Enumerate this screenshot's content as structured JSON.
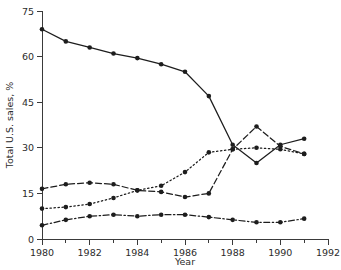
{
  "chart_data": {
    "type": "line",
    "title": "",
    "xlabel": "Year",
    "ylabel": "Total U.S. sales, %",
    "xlim": [
      1980,
      1992
    ],
    "ylim": [
      0,
      75
    ],
    "grid": false,
    "legend": "none",
    "x_major_ticks": [
      1980,
      1982,
      1984,
      1986,
      1988,
      1990,
      1992
    ],
    "x_minor_ticks": [
      1981,
      1983,
      1985,
      1987,
      1989,
      1991
    ],
    "x_tick_labels": [
      "1980",
      "1982",
      "1984",
      "1986",
      "1988",
      "1990",
      "1992"
    ],
    "y_ticks": [
      0,
      15,
      30,
      45,
      60,
      75
    ],
    "y_tick_labels": [
      "0",
      "15",
      "30",
      "45",
      "60",
      "75"
    ],
    "x": [
      1980,
      1981,
      1982,
      1983,
      1984,
      1985,
      1986,
      1987,
      1988,
      1989,
      1990,
      1991
    ],
    "series": [
      {
        "name": "series-solid",
        "style": "solid",
        "marker": "filled-circle",
        "values": [
          69,
          65,
          63,
          61,
          59.5,
          57.5,
          55,
          47,
          31,
          25,
          31,
          33
        ]
      },
      {
        "name": "series-dashed",
        "style": "dashed",
        "marker": "filled-circle",
        "values": [
          16.5,
          18,
          18.5,
          18,
          16,
          15.5,
          13.8,
          15,
          29.5,
          37,
          30.5,
          28
        ]
      },
      {
        "name": "series-dotted",
        "style": "dotted",
        "marker": "filled-circle",
        "values": [
          10,
          10.5,
          11.5,
          13.5,
          16,
          17.5,
          22,
          28.5,
          29.5,
          30,
          29.5,
          28
        ]
      },
      {
        "name": "series-dashdot",
        "style": "dash-dot",
        "marker": "filled-circle",
        "values": [
          4.5,
          6.3,
          7.5,
          8,
          7.5,
          8,
          8,
          7.2,
          6.3,
          5.5,
          5.5,
          6.7
        ]
      }
    ]
  },
  "colors": {
    "ink": "#1d1d1d",
    "axis": "#3a3a3a",
    "background": "#ffffff"
  }
}
